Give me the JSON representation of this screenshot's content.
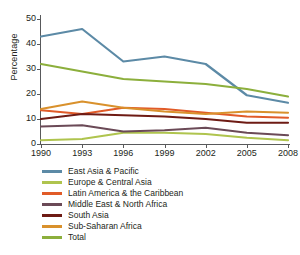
{
  "chart_data": {
    "type": "line",
    "title": "",
    "xlabel": "",
    "ylabel": "Percentage",
    "x": [
      1990,
      1993,
      1996,
      1999,
      2002,
      2005,
      2008
    ],
    "xtick_labels": [
      "1990",
      "1993",
      "1996",
      "1999",
      "2002",
      "2005",
      "2008"
    ],
    "ytick_labels": [
      "0",
      "10",
      "20",
      "30",
      "40",
      "50"
    ],
    "yticks": [
      0,
      10,
      20,
      30,
      40,
      50
    ],
    "ylim": [
      0,
      50
    ],
    "xlim": [
      1990,
      2008
    ],
    "grid": false,
    "legend_position": "below",
    "series": [
      {
        "name": "East Asia & Pacific",
        "color": "#5C8AA6",
        "values": [
          43,
          46,
          33,
          35,
          32,
          19.5,
          16.5
        ]
      },
      {
        "name": "Europe & Central Asia",
        "color": "#AFC44E",
        "values": [
          1.5,
          2,
          4.5,
          4.5,
          4,
          2.5,
          1.5
        ]
      },
      {
        "name": "Latin America & the Caribbean",
        "color": "#E15B28",
        "values": [
          13.5,
          12,
          14.5,
          14,
          12.5,
          11,
          10.5
        ]
      },
      {
        "name": "Middle East & North Africa",
        "color": "#6B4A57",
        "values": [
          7,
          7.5,
          5,
          5.5,
          6.5,
          4.5,
          3.5
        ]
      },
      {
        "name": "South Asia",
        "color": "#6E1B14",
        "values": [
          10,
          12,
          11.5,
          11,
          10,
          8.5,
          8.5
        ]
      },
      {
        "name": "Sub-Saharan Africa",
        "color": "#D9912C",
        "values": [
          14,
          17,
          14.5,
          13,
          12,
          13,
          12.5
        ]
      },
      {
        "name": "Total",
        "color": "#8CAF3C",
        "values": [
          32,
          29,
          26,
          25,
          24,
          22,
          19
        ]
      }
    ]
  },
  "legend": {
    "items": [
      {
        "label": "East Asia & Pacific",
        "color": "#5C8AA6"
      },
      {
        "label": "Europe & Central Asia",
        "color": "#AFC44E"
      },
      {
        "label": "Latin America & the Caribbean",
        "color": "#E15B28"
      },
      {
        "label": "Middle East & North Africa",
        "color": "#6B4A57"
      },
      {
        "label": "South Asia",
        "color": "#6E1B14"
      },
      {
        "label": "Sub-Saharan Africa",
        "color": "#D9912C"
      },
      {
        "label": "Total",
        "color": "#8CAF3C"
      }
    ]
  }
}
